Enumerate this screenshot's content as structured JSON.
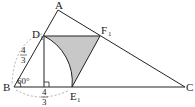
{
  "diagram": {
    "points": {
      "A": {
        "label": "A",
        "x": 58,
        "y": 10
      },
      "B": {
        "label": "B",
        "x": 14,
        "y": 87
      },
      "C": {
        "label": "C",
        "x": 185,
        "y": 87
      },
      "D1": {
        "label": "D",
        "sub": "1",
        "x": 44,
        "y": 36
      },
      "E1": {
        "label": "E",
        "sub": "1",
        "x": 72,
        "y": 87
      },
      "F1": {
        "label": "F",
        "sub": "1",
        "x": 100,
        "y": 36
      }
    },
    "angle_label": "60°",
    "frac_left": {
      "num": "4",
      "den": "3"
    },
    "frac_bottom": {
      "num": "4",
      "den": "3"
    },
    "colors": {
      "line": "#222222",
      "shade": "#c8c8c8",
      "dash": "#999999"
    }
  }
}
